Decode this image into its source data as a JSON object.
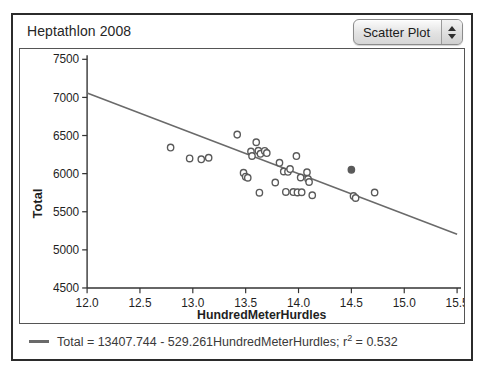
{
  "window": {
    "title": "Heptathlon 2008"
  },
  "controls": {
    "plot_type": {
      "selected": "Scatter Plot",
      "stepper_up_icon": "triangle-up-icon",
      "stepper_down_icon": "triangle-down-icon"
    }
  },
  "legend": {
    "equation_prefix": "Total = 13407.744 - 529.261HundredMeterHurdles; r",
    "equation_sup": "2",
    "equation_suffix": " = 0.532",
    "line_color": "#6a6a6a"
  },
  "chart_data": {
    "type": "scatter",
    "title": "Heptathlon 2008",
    "xlabel": "HundredMeterHurdles",
    "ylabel": "Total",
    "xlim": [
      12.0,
      15.5
    ],
    "ylim": [
      4500,
      7500
    ],
    "xticks": [
      "12.0",
      "12.5",
      "13.0",
      "13.5",
      "14.0",
      "14.5",
      "15.0",
      "15.5"
    ],
    "xtick_values": [
      12.0,
      12.5,
      13.0,
      13.5,
      14.0,
      14.5,
      15.0,
      15.5
    ],
    "yticks": [
      "4500",
      "5000",
      "5500",
      "6000",
      "6500",
      "7000",
      "7500"
    ],
    "ytick_values": [
      4500,
      5000,
      5500,
      6000,
      6500,
      7000,
      7500
    ],
    "grid": false,
    "legend_position": "bottom",
    "marker_style": "open-circle",
    "marker_color": "#5a5a5a",
    "point_color": "#5a5a5a",
    "line_color": "#6a6a6a",
    "fit_line": {
      "intercept": 13407.744,
      "slope": -529.261,
      "r_squared": 0.532,
      "equation": "Total = 13407.744 - 529.261HundredMeterHurdles; r2 = 0.532",
      "x_start": 12.0,
      "y_start": 7056.6,
      "x_end": 15.5,
      "y_end": 5204.1
    },
    "points": [
      {
        "x": 12.79,
        "y": 6342,
        "filled": false
      },
      {
        "x": 12.97,
        "y": 6200,
        "filled": false
      },
      {
        "x": 13.08,
        "y": 6188,
        "filled": false
      },
      {
        "x": 13.15,
        "y": 6208,
        "filled": false
      },
      {
        "x": 13.42,
        "y": 6512,
        "filled": false
      },
      {
        "x": 13.48,
        "y": 6010,
        "filled": false
      },
      {
        "x": 13.5,
        "y": 5960,
        "filled": false
      },
      {
        "x": 13.52,
        "y": 5946,
        "filled": false
      },
      {
        "x": 13.55,
        "y": 6290,
        "filled": false
      },
      {
        "x": 13.56,
        "y": 6232,
        "filled": false
      },
      {
        "x": 13.6,
        "y": 6412,
        "filled": false
      },
      {
        "x": 13.62,
        "y": 6300,
        "filled": false
      },
      {
        "x": 13.64,
        "y": 6260,
        "filled": false
      },
      {
        "x": 13.68,
        "y": 6298,
        "filled": false
      },
      {
        "x": 13.7,
        "y": 6270,
        "filled": false
      },
      {
        "x": 13.63,
        "y": 5750,
        "filled": false
      },
      {
        "x": 13.78,
        "y": 5884,
        "filled": false
      },
      {
        "x": 13.82,
        "y": 6142,
        "filled": false
      },
      {
        "x": 13.86,
        "y": 6028,
        "filled": false
      },
      {
        "x": 13.9,
        "y": 6024,
        "filled": false
      },
      {
        "x": 13.92,
        "y": 6060,
        "filled": false
      },
      {
        "x": 13.88,
        "y": 5760,
        "filled": false
      },
      {
        "x": 13.95,
        "y": 5758,
        "filled": false
      },
      {
        "x": 13.99,
        "y": 5754,
        "filled": false
      },
      {
        "x": 14.02,
        "y": 5950,
        "filled": false
      },
      {
        "x": 14.03,
        "y": 5756,
        "filled": false
      },
      {
        "x": 14.08,
        "y": 6018,
        "filled": false
      },
      {
        "x": 14.09,
        "y": 5930,
        "filled": false
      },
      {
        "x": 14.1,
        "y": 5890,
        "filled": false
      },
      {
        "x": 14.13,
        "y": 5716,
        "filled": false
      },
      {
        "x": 13.98,
        "y": 6230,
        "filled": false
      },
      {
        "x": 14.52,
        "y": 5706,
        "filled": false
      },
      {
        "x": 14.54,
        "y": 5680,
        "filled": false
      },
      {
        "x": 14.5,
        "y": 6052,
        "filled": true
      },
      {
        "x": 14.72,
        "y": 5752,
        "filled": false
      }
    ]
  }
}
